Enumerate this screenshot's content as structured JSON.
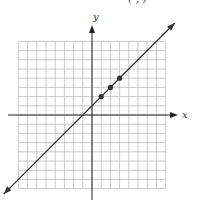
{
  "header": {
    "partial_label": "(·,·)"
  },
  "axes": {
    "x_label": "x",
    "y_label": "y"
  },
  "colors": {
    "grid": "#b5b5b5",
    "axis": "#222222",
    "line": "#333333",
    "point": "#333333"
  },
  "chart_data": {
    "type": "line",
    "title": "",
    "xlabel": "x",
    "ylabel": "y",
    "xlim": [
      -8,
      8
    ],
    "ylim": [
      -8,
      8
    ],
    "grid": true,
    "legend": null,
    "series": [
      {
        "name": "y = x + 1",
        "kind": "line",
        "slope": 1,
        "intercept": 1,
        "x": [
          -9,
          9
        ],
        "y": [
          -8,
          10
        ]
      },
      {
        "name": "plotted points",
        "kind": "scatter",
        "x": [
          1,
          2,
          3
        ],
        "y": [
          2,
          3,
          4
        ]
      }
    ],
    "annotations": []
  }
}
